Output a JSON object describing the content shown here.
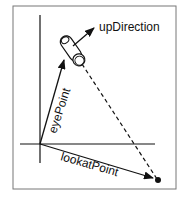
{
  "diagram": {
    "type": "camera-vectors",
    "labels": {
      "up": "upDirection",
      "eye": "eyePoint",
      "lookat": "lookatPoint"
    },
    "colors": {
      "frame": "#777777",
      "stroke": "#111111",
      "background": "#ffffff"
    }
  }
}
